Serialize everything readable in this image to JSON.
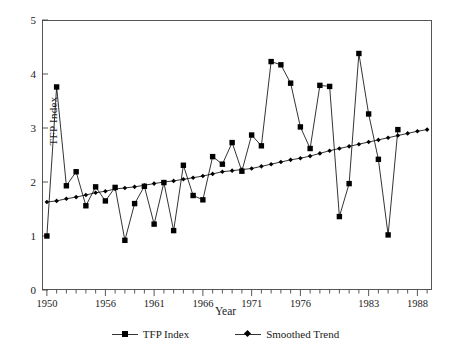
{
  "chart_data": {
    "type": "line",
    "title": "",
    "xlabel": "Year",
    "ylabel": "TFP Index",
    "xlim": [
      1949.5,
      1989.5
    ],
    "ylim": [
      0,
      5
    ],
    "grid": false,
    "legend_position": "bottom",
    "y_ticks": [
      0,
      1,
      2,
      3,
      4,
      5
    ],
    "x_ticks_labeled": [
      1950,
      1956,
      1961,
      1966,
      1971,
      1976,
      1983,
      1988
    ],
    "x_minor_tick_interval": 1,
    "x": [
      1950,
      1951,
      1952,
      1953,
      1954,
      1955,
      1956,
      1957,
      1958,
      1959,
      1960,
      1961,
      1962,
      1963,
      1964,
      1965,
      1966,
      1967,
      1968,
      1969,
      1970,
      1971,
      1972,
      1973,
      1974,
      1975,
      1976,
      1977,
      1978,
      1979,
      1980,
      1981,
      1982,
      1983,
      1984,
      1985,
      1986,
      1987,
      1988,
      1989
    ],
    "series": [
      {
        "name": "TFP Index",
        "marker": "square",
        "color": "#000000",
        "values": [
          1.0,
          3.76,
          1.93,
          2.19,
          1.56,
          1.91,
          1.65,
          1.9,
          0.92,
          1.6,
          1.92,
          1.22,
          1.99,
          1.1,
          2.31,
          1.75,
          1.67,
          2.47,
          2.33,
          2.73,
          2.2,
          2.87,
          2.67,
          4.23,
          4.17,
          3.83,
          3.02,
          2.62,
          3.79,
          3.77,
          1.36,
          1.97,
          4.38,
          3.26,
          2.42,
          1.02,
          2.97,
          null,
          null,
          null
        ]
      },
      {
        "name": "Smoothed Trend",
        "marker": "diamond",
        "color": "#000000",
        "values": [
          1.63,
          1.65,
          1.69,
          1.72,
          1.76,
          1.8,
          1.83,
          1.87,
          1.89,
          1.91,
          1.94,
          1.97,
          2.0,
          2.02,
          2.05,
          2.08,
          2.11,
          2.15,
          2.19,
          2.21,
          2.23,
          2.25,
          2.29,
          2.33,
          2.37,
          2.41,
          2.44,
          2.48,
          2.53,
          2.58,
          2.62,
          2.66,
          2.7,
          2.74,
          2.78,
          2.82,
          2.86,
          2.9,
          2.94,
          2.97
        ]
      }
    ]
  },
  "axes": {
    "y_title": "TFP Index",
    "x_title": "Year"
  },
  "legend": {
    "items": [
      {
        "label": "TFP Index",
        "marker": "square"
      },
      {
        "label": "Smoothed Trend",
        "marker": "diamond"
      }
    ]
  },
  "colors": {
    "ink": "#000000",
    "frame": "#555555",
    "background": "#ffffff"
  }
}
